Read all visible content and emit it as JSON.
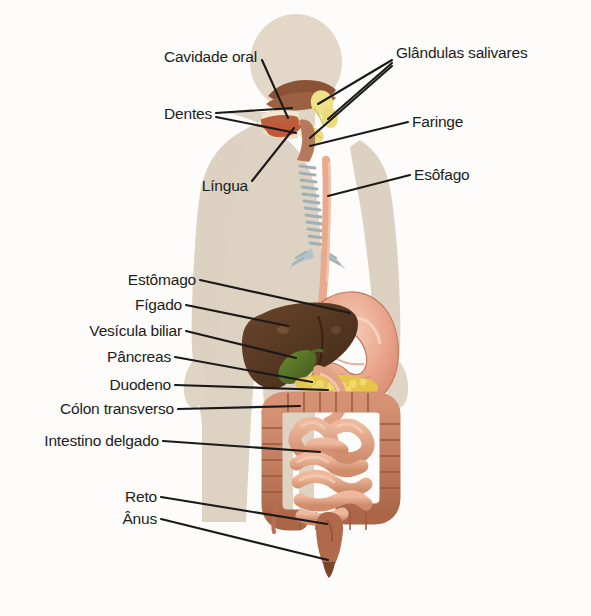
{
  "figure": {
    "language": "pt-BR",
    "background_color": "#fdfcfa",
    "body_silhouette_color": "#d9cfc0",
    "leader_line_color": "#1a1a1a"
  },
  "labels_left": [
    {
      "id": "cavidade-oral",
      "text": "Cavidade oral",
      "x": 257,
      "y": 57
    },
    {
      "id": "dentes",
      "text": "Dentes",
      "x": 212,
      "y": 114
    },
    {
      "id": "lingua",
      "text": "Língua",
      "x": 248,
      "y": 186
    },
    {
      "id": "estomago",
      "text": "Estômago",
      "x": 196,
      "y": 283
    },
    {
      "id": "figado",
      "text": "Fígado",
      "x": 182,
      "y": 307
    },
    {
      "id": "vesicula-biliar",
      "text": "Vesícula biliar",
      "x": 182,
      "y": 333
    },
    {
      "id": "pancreas",
      "text": "Pâncreas",
      "x": 171,
      "y": 359
    },
    {
      "id": "duodeno",
      "text": "Duodeno",
      "x": 171,
      "y": 387
    },
    {
      "id": "colon-transverso",
      "text": "Cólon transverso",
      "x": 174,
      "y": 411
    },
    {
      "id": "intestino-delgado",
      "text": "Intestino delgado",
      "x": 159,
      "y": 443
    },
    {
      "id": "reto",
      "text": "Reto",
      "x": 157,
      "y": 500
    },
    {
      "id": "anus",
      "text": "Ânus",
      "x": 157,
      "y": 522
    }
  ],
  "labels_right": [
    {
      "id": "glandulas-salivares",
      "text": "Glândulas salivares",
      "x": 396,
      "y": 55
    },
    {
      "id": "faringe",
      "text": "Faringe",
      "x": 412,
      "y": 124
    },
    {
      "id": "esofago",
      "text": "Esôfago",
      "x": 414,
      "y": 177
    }
  ],
  "organs": [
    {
      "id": "oral-cavity",
      "name": "Cavidade oral",
      "color": "#b9603c"
    },
    {
      "id": "teeth",
      "name": "Dentes",
      "color": "#f0e4cf"
    },
    {
      "id": "tongue",
      "name": "Língua",
      "color": "#c1583a"
    },
    {
      "id": "salivary-glands",
      "name": "Glândulas salivares",
      "color": "#efe08a"
    },
    {
      "id": "pharynx",
      "name": "Faringe",
      "color": "#b5785a"
    },
    {
      "id": "esophagus",
      "name": "Esôfago",
      "color": "#e8a98c"
    },
    {
      "id": "trachea",
      "name": "Traqueia",
      "color": "#a8b6bb"
    },
    {
      "id": "stomach",
      "name": "Estômago",
      "color": "#e9a58c"
    },
    {
      "id": "liver",
      "name": "Fígado",
      "color": "#5a3a23"
    },
    {
      "id": "gallbladder",
      "name": "Vesícula biliar",
      "color": "#4e6b24"
    },
    {
      "id": "pancreas",
      "name": "Pâncreas",
      "color": "#e5c64a"
    },
    {
      "id": "duodenum",
      "name": "Duodeno",
      "color": "#e0a384"
    },
    {
      "id": "transverse-colon",
      "name": "Cólon transverso",
      "color": "#c0775a"
    },
    {
      "id": "small-intestine",
      "name": "Intestino delgado",
      "color": "#e0a184"
    },
    {
      "id": "rectum",
      "name": "Reto",
      "color": "#b0694a"
    },
    {
      "id": "anus",
      "name": "Ânus",
      "color": "#7d4427"
    }
  ]
}
